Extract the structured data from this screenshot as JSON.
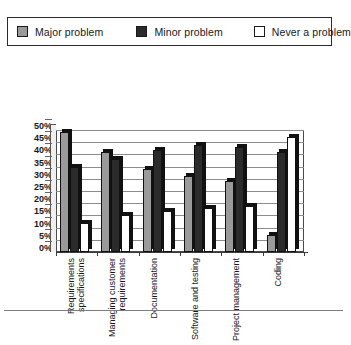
{
  "legend": {
    "items": [
      {
        "label": "Major problem",
        "color": "#9a9a9a"
      },
      {
        "label": "Minor problem",
        "color": "#2b2b2b"
      },
      {
        "label": "Never a problem",
        "color": "#ffffff"
      }
    ]
  },
  "axis": {
    "y_ticks": [
      "50%",
      "45%",
      "40%",
      "35%",
      "30%",
      "25%",
      "20%",
      "15%",
      "10%",
      "5%",
      "0%"
    ]
  },
  "chart_data": {
    "type": "bar",
    "title": "",
    "subtitle": "",
    "xlabel": "",
    "ylabel": "",
    "ylim": [
      0,
      50
    ],
    "ytick_step": 5,
    "ytick_format": "percent",
    "grid": true,
    "legend_position": "top",
    "style": "3d-clustered-column",
    "categories": [
      "Requirements specifications",
      "Managing customer requirements",
      "Documentation",
      "Software and testing",
      "Project management",
      "Coding"
    ],
    "category_lines": [
      [
        "Requirements",
        "specifications"
      ],
      [
        "Managing customer",
        "requirements"
      ],
      [
        "Documentation",
        ""
      ],
      [
        "Software and testing",
        ""
      ],
      [
        "Project management",
        ""
      ],
      [
        "Coding",
        ""
      ]
    ],
    "series": [
      {
        "name": "Major problem",
        "color": "#9a9a9a",
        "values": [
          49,
          41,
          34,
          31,
          29,
          7
        ]
      },
      {
        "name": "Minor problem",
        "color": "#2b2b2b",
        "values": [
          35,
          38,
          42,
          44,
          43,
          41
        ]
      },
      {
        "name": "Never a problem",
        "color": "#ffffff",
        "values": [
          12,
          15,
          17,
          18,
          19,
          47
        ]
      }
    ]
  }
}
